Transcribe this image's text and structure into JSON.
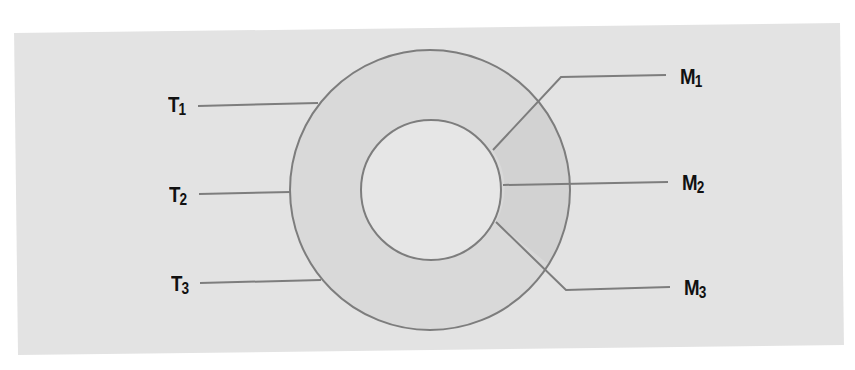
{
  "diagram": {
    "type": "concentric-ring-diagram",
    "colors": {
      "page_background": "#ffffff",
      "panel_background": "#e3e3e3",
      "ring_fill": "#d9d9d9",
      "right_segment_fill": "#d2d2d2",
      "inner_circle_fill": "#e6e6e6",
      "stroke": "#7d7d7d",
      "label_text": "#111111"
    },
    "outer_circle": {
      "cx": 430,
      "cy": 190,
      "r": 140
    },
    "inner_circle": {
      "cx": 431,
      "cy": 190,
      "r": 70
    },
    "left_labels": [
      {
        "id": "T1",
        "base": "T",
        "sub": "1"
      },
      {
        "id": "T2",
        "base": "T",
        "sub": "2"
      },
      {
        "id": "T3",
        "base": "T",
        "sub": "3"
      }
    ],
    "right_labels": [
      {
        "id": "M1",
        "base": "M",
        "sub": "1"
      },
      {
        "id": "M2",
        "base": "M",
        "sub": "2"
      },
      {
        "id": "M3",
        "base": "M",
        "sub": "3"
      }
    ],
    "connections": [
      {
        "label": "T1",
        "target": "outer circle (upper-left)"
      },
      {
        "label": "T2",
        "target": "outer circle (left)"
      },
      {
        "label": "T3",
        "target": "outer circle (lower-left)"
      },
      {
        "label": "M1",
        "target": "inner circle (upper-right), segment boundary"
      },
      {
        "label": "M2",
        "target": "inner circle (right), segment boundary"
      },
      {
        "label": "M3",
        "target": "inner circle (lower-right), segment boundary"
      }
    ]
  }
}
